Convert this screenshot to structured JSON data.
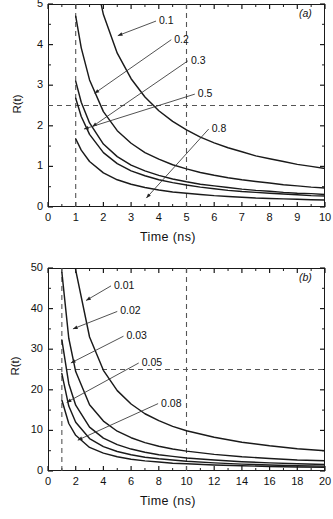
{
  "figure": {
    "background": "#ffffff",
    "curve_color": "#1a1a1a",
    "dash_color": "#555555",
    "axis_color": "#1a1a1a"
  },
  "chart_data": [
    {
      "type": "line",
      "panel": "(a)",
      "title": "",
      "xlabel": "Time  (ns)",
      "ylabel": "R(t)",
      "xlim": [
        0,
        10
      ],
      "ylim": [
        0,
        5
      ],
      "xticks": [
        0,
        1,
        2,
        3,
        4,
        5,
        6,
        7,
        8,
        9,
        10
      ],
      "xtick_labels": [
        "0",
        "1",
        "2",
        "3",
        "4",
        "5",
        "6",
        "7",
        "8",
        "9",
        "10"
      ],
      "yticks": [
        0,
        1,
        2,
        3,
        4,
        5
      ],
      "ytick_labels": [
        "0",
        "1",
        "2",
        "3",
        "4",
        "5"
      ],
      "grid": false,
      "legend": "inline-annotations",
      "reference_lines": [
        {
          "orientation": "vertical",
          "value": 1,
          "style": "dashed"
        },
        {
          "orientation": "vertical",
          "value": 5,
          "style": "dashed"
        },
        {
          "orientation": "horizontal",
          "value": 2.5,
          "style": "dashed"
        }
      ],
      "series": [
        {
          "name": "0.1",
          "label": "0.1",
          "param": 0.1,
          "x": [
            1.0,
            1.2,
            1.5,
            2.0,
            2.5,
            3.0,
            3.5,
            4.0,
            4.5,
            5.0,
            5.5,
            6.0,
            6.5,
            7.0,
            7.5,
            8.0,
            8.5,
            9.0,
            9.5,
            10.0
          ],
          "y": [
            9.5,
            7.9,
            6.3,
            4.74,
            3.79,
            3.16,
            2.71,
            2.37,
            2.11,
            1.9,
            1.72,
            1.58,
            1.46,
            1.36,
            1.26,
            1.19,
            1.12,
            1.05,
            1.0,
            0.95
          ]
        },
        {
          "name": "0.2",
          "label": "0.2",
          "param": 0.2,
          "x": [
            1.0,
            1.2,
            1.5,
            2.0,
            2.5,
            3.0,
            3.5,
            4.0,
            4.5,
            5.0,
            5.5,
            6.0,
            6.5,
            7.0,
            7.5,
            8.0,
            8.5,
            9.0,
            9.5,
            10.0
          ],
          "y": [
            4.7,
            3.92,
            3.13,
            2.35,
            1.88,
            1.57,
            1.34,
            1.18,
            1.04,
            0.94,
            0.85,
            0.78,
            0.72,
            0.67,
            0.63,
            0.59,
            0.55,
            0.52,
            0.49,
            0.47
          ]
        },
        {
          "name": "0.3",
          "label": "0.3",
          "param": 0.3,
          "x": [
            1.0,
            1.2,
            1.5,
            2.0,
            2.5,
            3.0,
            3.5,
            4.0,
            4.5,
            5.0,
            5.5,
            6.0,
            6.5,
            7.0,
            7.5,
            8.0,
            8.5,
            9.0,
            9.5,
            10.0
          ],
          "y": [
            3.1,
            2.58,
            2.07,
            1.55,
            1.24,
            1.03,
            0.89,
            0.78,
            0.69,
            0.62,
            0.56,
            0.52,
            0.48,
            0.44,
            0.41,
            0.39,
            0.36,
            0.34,
            0.33,
            0.31
          ]
        },
        {
          "name": "0.5",
          "label": "0.5",
          "param": 0.5,
          "x": [
            1.0,
            1.2,
            1.5,
            2.0,
            2.5,
            3.0,
            3.5,
            4.0,
            4.5,
            5.0,
            5.5,
            6.0,
            6.5,
            7.0,
            7.5,
            8.0,
            8.5,
            9.0,
            9.5,
            10.0
          ],
          "y": [
            2.68,
            2.23,
            1.79,
            1.34,
            1.07,
            0.89,
            0.77,
            0.67,
            0.6,
            0.54,
            0.49,
            0.45,
            0.41,
            0.38,
            0.36,
            0.34,
            0.32,
            0.3,
            0.28,
            0.27
          ]
        },
        {
          "name": "0.8",
          "label": "0.8",
          "param": 0.8,
          "x": [
            1.0,
            1.2,
            1.5,
            2.0,
            2.5,
            3.0,
            3.5,
            4.0,
            4.5,
            5.0,
            5.5,
            6.0,
            6.5,
            7.0,
            7.5,
            8.0,
            8.5,
            9.0,
            9.5,
            10.0
          ],
          "y": [
            1.68,
            1.4,
            1.12,
            0.84,
            0.67,
            0.56,
            0.48,
            0.42,
            0.37,
            0.34,
            0.31,
            0.28,
            0.26,
            0.24,
            0.22,
            0.21,
            0.2,
            0.19,
            0.18,
            0.17
          ]
        }
      ],
      "annotations": [
        {
          "text": "0.1",
          "label_x": 3.9,
          "label_y": 4.58,
          "tip_x": 2.52,
          "tip_y": 4.22
        },
        {
          "text": "0.2",
          "label_x": 4.45,
          "label_y": 4.12,
          "tip_x": 1.68,
          "tip_y": 2.8
        },
        {
          "text": "0.3",
          "label_x": 5.05,
          "label_y": 3.6,
          "tip_x": 1.6,
          "tip_y": 1.98
        },
        {
          "text": "0.5",
          "label_x": 5.3,
          "label_y": 2.78,
          "tip_x": 1.3,
          "tip_y": 1.92
        },
        {
          "text": "0.8",
          "label_x": 5.8,
          "label_y": 1.92,
          "tip_x": 3.55,
          "tip_y": 0.22
        }
      ]
    },
    {
      "type": "line",
      "panel": "(b)",
      "title": "",
      "xlabel": "Time  (ns)",
      "ylabel": "R(t)",
      "xlim": [
        0,
        20
      ],
      "ylim": [
        0,
        50
      ],
      "xticks": [
        0,
        2,
        4,
        6,
        8,
        10,
        12,
        14,
        16,
        18,
        20
      ],
      "xtick_labels": [
        "0",
        "2",
        "4",
        "6",
        "8",
        "10",
        "12",
        "14",
        "16",
        "18",
        "20"
      ],
      "yticks": [
        0,
        10,
        20,
        30,
        40,
        50
      ],
      "ytick_labels": [
        "0",
        "10",
        "20",
        "30",
        "40",
        "50"
      ],
      "grid": false,
      "legend": "inline-annotations",
      "reference_lines": [
        {
          "orientation": "vertical",
          "value": 1,
          "style": "dashed"
        },
        {
          "orientation": "vertical",
          "value": 10,
          "style": "dashed"
        },
        {
          "orientation": "horizontal",
          "value": 25,
          "style": "dashed"
        }
      ],
      "series": [
        {
          "name": "0.01",
          "label": "0.01",
          "param": 0.01,
          "x": [
            1.0,
            1.5,
            2.0,
            3.0,
            4.0,
            5.0,
            6.0,
            7.0,
            8.0,
            9.0,
            10.0,
            12.0,
            14.0,
            16.0,
            18.0,
            20.0
          ],
          "y": [
            99.0,
            66.0,
            49.5,
            33.0,
            24.8,
            19.8,
            16.5,
            14.1,
            12.4,
            11.0,
            9.9,
            8.3,
            7.1,
            6.2,
            5.5,
            5.0
          ]
        },
        {
          "name": "0.02",
          "label": "0.02",
          "param": 0.02,
          "x": [
            1.0,
            1.5,
            2.0,
            3.0,
            4.0,
            5.0,
            6.0,
            7.0,
            8.0,
            9.0,
            10.0,
            12.0,
            14.0,
            16.0,
            18.0,
            20.0
          ],
          "y": [
            49.0,
            32.7,
            24.5,
            16.3,
            12.3,
            9.8,
            8.2,
            7.0,
            6.1,
            5.4,
            4.9,
            4.1,
            3.5,
            3.1,
            2.7,
            2.5
          ]
        },
        {
          "name": "0.03",
          "label": "0.03",
          "param": 0.03,
          "x": [
            1.0,
            1.5,
            2.0,
            3.0,
            4.0,
            5.0,
            6.0,
            7.0,
            8.0,
            9.0,
            10.0,
            12.0,
            14.0,
            16.0,
            18.0,
            20.0
          ],
          "y": [
            32.3,
            21.5,
            16.2,
            10.8,
            8.1,
            6.5,
            5.4,
            4.6,
            4.0,
            3.6,
            3.2,
            2.7,
            2.3,
            2.0,
            1.8,
            1.6
          ]
        },
        {
          "name": "0.05",
          "label": "0.05",
          "param": 0.05,
          "x": [
            1.0,
            1.5,
            2.0,
            3.0,
            4.0,
            5.0,
            6.0,
            7.0,
            8.0,
            9.0,
            10.0,
            12.0,
            14.0,
            16.0,
            18.0,
            20.0
          ],
          "y": [
            24.0,
            16.0,
            12.0,
            8.0,
            6.0,
            4.8,
            4.0,
            3.4,
            3.0,
            2.7,
            2.4,
            2.0,
            1.7,
            1.5,
            1.3,
            1.2
          ]
        },
        {
          "name": "0.08",
          "label": "0.08",
          "param": 0.08,
          "x": [
            1.0,
            1.5,
            2.0,
            3.0,
            4.0,
            5.0,
            6.0,
            7.0,
            8.0,
            9.0,
            10.0,
            12.0,
            14.0,
            16.0,
            18.0,
            20.0
          ],
          "y": [
            17.5,
            11.7,
            8.8,
            5.8,
            4.4,
            3.5,
            2.9,
            2.5,
            2.2,
            1.9,
            1.8,
            1.5,
            1.3,
            1.1,
            1.0,
            0.9
          ]
        }
      ],
      "annotations": [
        {
          "text": "0.01",
          "label_x": 4.55,
          "label_y": 45.6,
          "tip_x": 2.75,
          "tip_y": 42.0
        },
        {
          "text": "0.02",
          "label_x": 5.0,
          "label_y": 39.3,
          "tip_x": 1.8,
          "tip_y": 35.0
        },
        {
          "text": "0.03",
          "label_x": 5.45,
          "label_y": 33.2,
          "tip_x": 1.65,
          "tip_y": 26.6
        },
        {
          "text": "0.05",
          "label_x": 6.55,
          "label_y": 26.6,
          "tip_x": 1.35,
          "tip_y": 16.9
        },
        {
          "text": "0.08",
          "label_x": 7.95,
          "label_y": 16.6,
          "tip_x": 2.15,
          "tip_y": 7.6
        }
      ]
    }
  ]
}
